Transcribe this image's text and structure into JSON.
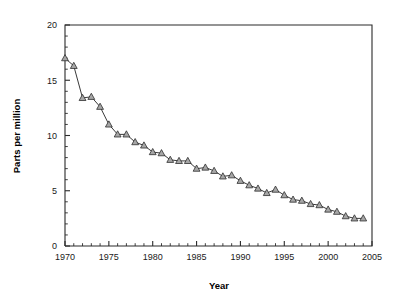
{
  "chart_data": {
    "type": "line",
    "title": "",
    "subtitle": "",
    "xlabel": "Year",
    "ylabel": "Parts per million",
    "xlim": [
      1970,
      2005
    ],
    "ylim": [
      0,
      20
    ],
    "grid": false,
    "legend": null,
    "x_major_ticks": [
      1970,
      1975,
      1980,
      1985,
      1990,
      1995,
      2000,
      2005
    ],
    "x_major_tick_labels": [
      "1970",
      "1975",
      "1980",
      "1985",
      "1990",
      "1995",
      "2000",
      "2005"
    ],
    "x_minor_tick_interval": 1,
    "y_major_ticks": [
      0,
      5,
      10,
      15,
      20
    ],
    "y_major_tick_labels": [
      "0",
      "5",
      "10",
      "15",
      "20"
    ],
    "y_minor_tick_interval": 1,
    "marker": "triangle-up",
    "marker_fill": "#a6a6a6",
    "marker_edge": "#2f2f2f",
    "line_color": "#3a3a3a",
    "x": [
      1970,
      1971,
      1972,
      1973,
      1974,
      1975,
      1976,
      1977,
      1978,
      1979,
      1980,
      1981,
      1982,
      1983,
      1984,
      1985,
      1986,
      1987,
      1988,
      1989,
      1990,
      1991,
      1992,
      1993,
      1994,
      1995,
      1996,
      1997,
      1998,
      1999,
      2000,
      2001,
      2002,
      2003,
      2004
    ],
    "values": [
      17.0,
      16.3,
      13.4,
      13.5,
      12.6,
      11.0,
      10.1,
      10.1,
      9.4,
      9.1,
      8.5,
      8.4,
      7.8,
      7.7,
      7.7,
      7.0,
      7.1,
      6.8,
      6.3,
      6.4,
      5.9,
      5.5,
      5.2,
      4.8,
      5.1,
      4.6,
      4.2,
      4.1,
      3.8,
      3.7,
      3.3,
      3.1,
      2.7,
      2.5,
      2.5
    ],
    "series": [
      {
        "name": "Parts per million",
        "values": [
          17.0,
          16.3,
          13.4,
          13.5,
          12.6,
          11.0,
          10.1,
          10.1,
          9.4,
          9.1,
          8.5,
          8.4,
          7.8,
          7.7,
          7.7,
          7.0,
          7.1,
          6.8,
          6.3,
          6.4,
          5.9,
          5.5,
          5.2,
          4.8,
          5.1,
          4.6,
          4.2,
          4.1,
          3.8,
          3.7,
          3.3,
          3.1,
          2.7,
          2.5,
          2.5
        ]
      }
    ]
  }
}
